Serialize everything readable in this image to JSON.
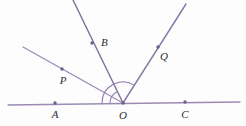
{
  "figure": {
    "type": "geometry-diagram",
    "width": 246,
    "height": 126,
    "background_color": "#fdfdfe"
  },
  "colors": {
    "baseline_stroke": "#9b8bb4",
    "ray_stroke": "#7d6e9e",
    "ray_light_stroke": "#9b8bb4",
    "arc_stroke": "#8a7aa8",
    "point_fill": "#6b5f88",
    "label_fill": "#2c2c33"
  },
  "geometry": {
    "vertex": {
      "name": "O",
      "x": 123,
      "y": 103
    },
    "baseline": {
      "name": "line-AC",
      "x1": 8,
      "y1": 105,
      "x2": 240,
      "y2": 102
    },
    "rays": [
      {
        "name": "ray-OP",
        "through": "P",
        "x1": 123,
        "y1": 103,
        "x2": 23,
        "y2": 47,
        "style": "light"
      },
      {
        "name": "ray-OB",
        "through": "B",
        "x1": 123,
        "y1": 103,
        "x2": 73,
        "y2": 0,
        "style": "dark"
      },
      {
        "name": "ray-OQ",
        "through": "Q",
        "x1": 123,
        "y1": 103,
        "x2": 186,
        "y2": 4,
        "style": "dark"
      }
    ],
    "arcs": [
      {
        "name": "angle-arc-AOQ",
        "radius": 21,
        "path": "M 102 103 A 21 21 0 0 1 133.6 84.9"
      },
      {
        "name": "angle-arc-AOB",
        "radius": 13,
        "path": "M 110 103 A 13 13 0 0 1 116.8 91.8"
      }
    ],
    "points": [
      {
        "name": "point-A",
        "label": "A",
        "x": 55,
        "y": 103,
        "label_x": 55,
        "label_y": 118
      },
      {
        "name": "point-O",
        "label": "O",
        "x": 123,
        "y": 103,
        "label_x": 123,
        "label_y": 119
      },
      {
        "name": "point-C",
        "label": "C",
        "x": 185,
        "y": 102,
        "label_x": 185,
        "label_y": 118
      },
      {
        "name": "point-P",
        "label": "P",
        "x": 62,
        "y": 69,
        "label_x": 63,
        "label_y": 84
      },
      {
        "name": "point-B",
        "label": "B",
        "x": 92,
        "y": 43,
        "label_x": 101,
        "label_y": 45
      },
      {
        "name": "point-Q",
        "label": "Q",
        "x": 158,
        "y": 47,
        "label_x": 160,
        "label_y": 60
      }
    ]
  }
}
